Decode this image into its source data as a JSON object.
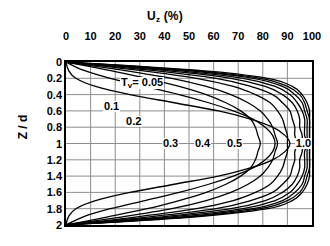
{
  "chart_data": {
    "type": "line",
    "title": "U",
    "title_sub": "z",
    "title_suffix": " (%)",
    "title_full": "Uz (%)",
    "xlabel": "Uz (%)",
    "ylabel": "Z / d",
    "xlim": [
      0,
      100
    ],
    "ylim": [
      0,
      2
    ],
    "xticks": [
      0,
      10,
      20,
      30,
      40,
      50,
      60,
      70,
      80,
      90,
      100
    ],
    "xtick_labels": [
      "0",
      "10",
      "20",
      "30",
      "40",
      "50",
      "60",
      "70",
      "80",
      "90",
      "100"
    ],
    "yticks": [
      0,
      0.2,
      0.4,
      0.6,
      0.8,
      1,
      1.2,
      1.4,
      1.6,
      1.8,
      2
    ],
    "ytick_labels": [
      "0",
      "0.2",
      "0.4",
      "0.6",
      "0.8",
      "1",
      "1.2",
      "1.4",
      "1.6",
      "1.8",
      "2"
    ],
    "grid": true,
    "grid_x_step": 10,
    "grid_y_step": 0.2,
    "legend": "inline-labels",
    "legend_position": "inline",
    "series_param_name": "Tv",
    "series_param_label": "T",
    "series_param_sub": "v",
    "line_color": "#000000",
    "grid_color": "#8d8d8d",
    "frame_color": "#000000",
    "annotations": [
      {
        "text": "Tv= 0.05",
        "value": 0.05,
        "x_pct": 22,
        "z": 0.26
      },
      {
        "text": "0.1",
        "value": 0.1,
        "x_pct": 15,
        "z": 0.55
      },
      {
        "text": "0.2",
        "value": 0.2,
        "x_pct": 24,
        "z": 0.74
      },
      {
        "text": "0.3",
        "value": 0.3,
        "x_pct": 39,
        "z": 1.0
      },
      {
        "text": "0.4",
        "value": 0.4,
        "x_pct": 52,
        "z": 1.0
      },
      {
        "text": "0.5",
        "value": 0.5,
        "x_pct": 65,
        "z": 1.0
      },
      {
        "text": "1.0",
        "value": 1.0,
        "x_pct": 93,
        "z": 1.0
      }
    ],
    "series": [
      {
        "name": "Tv = 0.05",
        "value": 0.05,
        "label": "0.05",
        "u_percent": [
          0,
          1,
          4,
          12,
          26,
          44,
          62,
          75,
          84,
          89,
          91,
          89,
          84,
          75,
          62,
          44,
          26,
          12,
          4,
          1,
          0
        ],
        "z_over_d": [
          0,
          0.1,
          0.2,
          0.3,
          0.4,
          0.5,
          0.6,
          0.7,
          0.8,
          0.9,
          1.0,
          1.1,
          1.2,
          1.3,
          1.4,
          1.5,
          1.6,
          1.7,
          1.8,
          1.9,
          2.0
        ]
      },
      {
        "name": "Tv = 0.1",
        "value": 0.1,
        "label": "0.1",
        "u_percent": [
          0,
          7,
          18,
          32,
          46,
          58,
          68,
          76,
          81,
          84,
          85,
          84,
          81,
          76,
          68,
          58,
          46,
          32,
          18,
          7,
          0
        ],
        "z_over_d": [
          0,
          0.1,
          0.2,
          0.3,
          0.4,
          0.5,
          0.6,
          0.7,
          0.8,
          0.9,
          1.0,
          1.1,
          1.2,
          1.3,
          1.4,
          1.5,
          1.6,
          1.7,
          1.8,
          1.9,
          2.0
        ]
      },
      {
        "name": "Tv = 0.2",
        "value": 0.2,
        "label": "0.2",
        "u_percent": [
          0,
          17,
          33,
          46,
          57,
          65,
          71,
          75,
          77,
          78,
          79,
          78,
          77,
          75,
          71,
          65,
          57,
          46,
          33,
          17,
          0
        ],
        "z_over_d": [
          0,
          0.1,
          0.2,
          0.3,
          0.4,
          0.5,
          0.6,
          0.7,
          0.8,
          0.9,
          1.0,
          1.1,
          1.2,
          1.3,
          1.4,
          1.5,
          1.6,
          1.7,
          1.8,
          1.9,
          2.0
        ]
      },
      {
        "name": "Tv = 0.3",
        "value": 0.3,
        "label": "0.3",
        "u_percent": [
          0,
          23,
          43,
          57,
          67,
          74,
          79,
          82,
          84,
          85,
          86,
          85,
          84,
          82,
          79,
          74,
          67,
          57,
          43,
          23,
          0
        ],
        "z_over_d": [
          0,
          0.1,
          0.2,
          0.3,
          0.4,
          0.5,
          0.6,
          0.7,
          0.8,
          0.9,
          1.0,
          1.1,
          1.2,
          1.3,
          1.4,
          1.5,
          1.6,
          1.7,
          1.8,
          1.9,
          2.0
        ]
      },
      {
        "name": "Tv = 0.4",
        "value": 0.4,
        "label": "0.4",
        "u_percent": [
          0,
          29,
          53,
          68,
          77,
          83,
          86,
          88,
          89,
          90,
          90,
          90,
          89,
          88,
          86,
          83,
          77,
          68,
          53,
          29,
          0
        ],
        "z_over_d": [
          0,
          0.1,
          0.2,
          0.3,
          0.4,
          0.5,
          0.6,
          0.7,
          0.8,
          0.9,
          1.0,
          1.1,
          1.2,
          1.3,
          1.4,
          1.5,
          1.6,
          1.7,
          1.8,
          1.9,
          2.0
        ]
      },
      {
        "name": "Tv = 0.5",
        "value": 0.5,
        "label": "0.5",
        "u_percent": [
          0,
          34,
          61,
          75,
          84,
          88,
          91,
          92,
          93,
          93,
          94,
          93,
          93,
          92,
          91,
          88,
          84,
          75,
          61,
          34,
          0
        ],
        "z_over_d": [
          0,
          0.1,
          0.2,
          0.3,
          0.4,
          0.5,
          0.6,
          0.7,
          0.8,
          0.9,
          1.0,
          1.1,
          1.2,
          1.3,
          1.4,
          1.5,
          1.6,
          1.7,
          1.8,
          1.9,
          2.0
        ]
      },
      {
        "name": "Tv = 0.6",
        "value": 0.6,
        "label": "",
        "u_percent": [
          0,
          39,
          67,
          81,
          88,
          92,
          94,
          95,
          95,
          96,
          96,
          96,
          95,
          95,
          94,
          92,
          88,
          81,
          67,
          39,
          0
        ],
        "z_over_d": [
          0,
          0.1,
          0.2,
          0.3,
          0.4,
          0.5,
          0.6,
          0.7,
          0.8,
          0.9,
          1.0,
          1.1,
          1.2,
          1.3,
          1.4,
          1.5,
          1.6,
          1.7,
          1.8,
          1.9,
          2.0
        ]
      },
      {
        "name": "Tv = 0.7",
        "value": 0.7,
        "label": "",
        "u_percent": [
          0,
          43,
          72,
          85,
          91,
          94,
          96,
          97,
          97,
          97,
          98,
          97,
          97,
          97,
          96,
          94,
          91,
          85,
          72,
          43,
          0
        ],
        "z_over_d": [
          0,
          0.1,
          0.2,
          0.3,
          0.4,
          0.5,
          0.6,
          0.7,
          0.8,
          0.9,
          1.0,
          1.1,
          1.2,
          1.3,
          1.4,
          1.5,
          1.6,
          1.7,
          1.8,
          1.9,
          2.0
        ]
      },
      {
        "name": "Tv = 0.8",
        "value": 0.8,
        "label": "",
        "u_percent": [
          0,
          47,
          76,
          88,
          93,
          96,
          97,
          98,
          98,
          98,
          98,
          98,
          98,
          98,
          97,
          96,
          93,
          88,
          76,
          47,
          0
        ],
        "z_over_d": [
          0,
          0.1,
          0.2,
          0.3,
          0.4,
          0.5,
          0.6,
          0.7,
          0.8,
          0.9,
          1.0,
          1.1,
          1.2,
          1.3,
          1.4,
          1.5,
          1.6,
          1.7,
          1.8,
          1.9,
          2.0
        ]
      },
      {
        "name": "Tv = 0.9",
        "value": 0.9,
        "label": "",
        "u_percent": [
          0,
          50,
          79,
          90,
          95,
          97,
          98,
          99,
          99,
          99,
          99,
          99,
          99,
          99,
          98,
          97,
          95,
          90,
          79,
          50,
          0
        ],
        "z_over_d": [
          0,
          0.1,
          0.2,
          0.3,
          0.4,
          0.5,
          0.6,
          0.7,
          0.8,
          0.9,
          1.0,
          1.1,
          1.2,
          1.3,
          1.4,
          1.5,
          1.6,
          1.7,
          1.8,
          1.9,
          2.0
        ]
      },
      {
        "name": "Tv = 1.0",
        "value": 1.0,
        "label": "1.0",
        "u_percent": [
          0,
          53,
          82,
          92,
          96,
          98,
          99,
          99,
          99,
          99,
          99,
          99,
          99,
          99,
          99,
          98,
          96,
          92,
          82,
          53,
          0
        ],
        "z_over_d": [
          0,
          0.1,
          0.2,
          0.3,
          0.4,
          0.5,
          0.6,
          0.7,
          0.8,
          0.9,
          1.0,
          1.1,
          1.2,
          1.3,
          1.4,
          1.5,
          1.6,
          1.7,
          1.8,
          1.9,
          2.0
        ]
      }
    ]
  }
}
